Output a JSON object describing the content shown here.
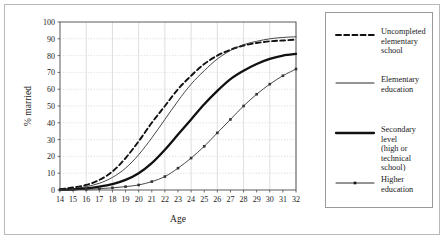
{
  "chart_data": {
    "type": "line",
    "title": "",
    "xlabel": "Age",
    "ylabel": "% married",
    "xlim": [
      14,
      32
    ],
    "ylim": [
      0,
      100
    ],
    "xticks": [
      14,
      15,
      16,
      17,
      18,
      19,
      20,
      21,
      22,
      23,
      24,
      25,
      26,
      27,
      28,
      29,
      30,
      31,
      32
    ],
    "yticks": [
      0,
      10,
      20,
      30,
      40,
      50,
      60,
      70,
      80,
      90,
      100
    ],
    "grid": true,
    "legend_position": "right-outside",
    "x": [
      14,
      15,
      16,
      17,
      18,
      19,
      20,
      21,
      22,
      23,
      24,
      25,
      26,
      27,
      28,
      29,
      30,
      31,
      32
    ],
    "series": [
      {
        "name": "Uncompleted elementary school",
        "style": "dashed",
        "marker": "none",
        "color": "#111111",
        "values": [
          0.5,
          1.5,
          3,
          6,
          11,
          19,
          29,
          40,
          50,
          60,
          68,
          75,
          80,
          83.5,
          86,
          87.5,
          88.5,
          89,
          89.5
        ]
      },
      {
        "name": "Elementary education",
        "style": "solid-thin",
        "marker": "none",
        "color": "#333333",
        "values": [
          0.3,
          0.8,
          2,
          4,
          7.5,
          13,
          21,
          31,
          42,
          53,
          63,
          71,
          78,
          83,
          86.5,
          88.5,
          90,
          90.8,
          91.2
        ]
      },
      {
        "name": "Secondary level (high or technical school)",
        "style": "solid-thick",
        "marker": "none",
        "color": "#111111",
        "values": [
          0.2,
          0.4,
          1,
          2,
          3.5,
          6,
          10,
          16,
          24,
          33,
          42,
          51,
          59,
          66,
          71,
          75,
          78,
          80,
          81
        ]
      },
      {
        "name": "Higher education",
        "style": "solid-thin-marker",
        "marker": "square",
        "color": "#333333",
        "values": [
          0.1,
          0.2,
          0.4,
          0.8,
          1.3,
          2,
          3,
          5,
          8,
          13,
          19,
          26,
          34,
          42,
          50,
          57,
          63,
          68,
          72
        ]
      }
    ]
  },
  "legend": {
    "items": [
      {
        "label": "Uncompleted\nelementary school",
        "style": "dashed"
      },
      {
        "label": "Elementary\neducation",
        "style": "solid-thin"
      },
      {
        "label": "Secondary level\n(high or technical\nschool)",
        "style": "solid-thick"
      },
      {
        "label": "Higher education",
        "style": "solid-thin-marker"
      }
    ]
  }
}
